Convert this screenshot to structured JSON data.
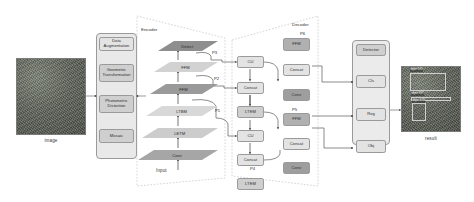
{
  "figure": {
    "type": "neural-network-architecture-diagram"
  },
  "input": {
    "caption": "image"
  },
  "preprocess": {
    "items": [
      {
        "label": "Data Augmentation"
      },
      {
        "label": "Geometric\nTransformation"
      },
      {
        "label": "Photometric\nDistortion"
      },
      {
        "label": "Mosaic"
      }
    ]
  },
  "encoder": {
    "title": "Encoder",
    "input_label": "Input",
    "layers": [
      {
        "label": "Detect"
      },
      {
        "label": "FFM"
      },
      {
        "label": "FFM"
      },
      {
        "label": "LTBM"
      },
      {
        "label": "LETM"
      },
      {
        "label": "Conv"
      }
    ],
    "taps": [
      {
        "label": "P3"
      },
      {
        "label": "P2"
      },
      {
        "label": "P1"
      }
    ]
  },
  "decoder": {
    "title": "Decoder",
    "top_tap": "P6",
    "mid_tap": "P5",
    "low_tap": "P4",
    "left_column": [
      {
        "label": "CU"
      },
      {
        "label": "Concat"
      },
      {
        "label": "LTEM"
      },
      {
        "label": "CU"
      },
      {
        "label": "Concat"
      },
      {
        "label": "LTEM"
      }
    ],
    "right_column": [
      {
        "label": "FFM"
      },
      {
        "label": "Concat"
      },
      {
        "label": "Conv"
      },
      {
        "label": "FFM"
      },
      {
        "label": "Concat"
      },
      {
        "label": "Conv"
      }
    ]
  },
  "detector": {
    "title": "Detector",
    "heads": [
      {
        "label": "Cls"
      },
      {
        "label": "Reg"
      },
      {
        "label": "Obj"
      }
    ]
  },
  "result": {
    "caption": "result",
    "detections": [
      {
        "label": "object 0.91"
      },
      {
        "label": "object 0.87"
      },
      {
        "label": "object 0.74"
      }
    ]
  },
  "colors": {
    "stroke": "#8a8a8a",
    "dashed": "#b4b4b4",
    "text": "#2e2e2e",
    "panel": "#e9e9e9"
  }
}
